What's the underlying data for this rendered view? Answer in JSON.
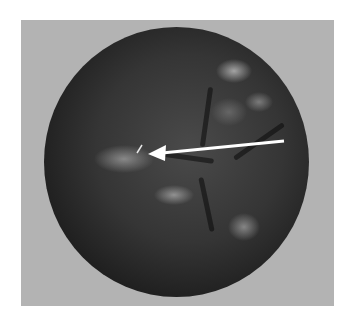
{
  "image": {
    "description": "Grayscale rendered sphere with surface bumps and crevices, white arrow pointing left at a small marker on the surface",
    "background_color": "#ffffff",
    "frame_color": "#b3b3b3",
    "sphere_color": "#2a2a2a",
    "arrow_color": "#ffffff",
    "arrow": {
      "from": [
        284,
        141
      ],
      "to": [
        150,
        154
      ],
      "icon": "arrow-left-icon"
    },
    "marker": {
      "position": [
        140,
        149
      ],
      "icon": "small-slash-marker"
    }
  }
}
